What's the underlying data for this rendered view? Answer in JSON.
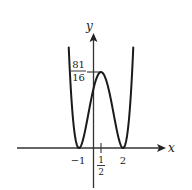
{
  "figure": {
    "function": "f(x) = (x+1)^2 (x-2)^2",
    "axes": {
      "x_label": "x",
      "y_label": "y"
    },
    "labels": {
      "max_value_num": "81",
      "max_value_den": "16",
      "x_tick_neg1": "−1",
      "x_tick_half_num": "1",
      "x_tick_half_den": "2",
      "x_tick_2": "2"
    },
    "colors": {
      "curve": "#1a1a1a",
      "axis": "#333333",
      "background": "#ffffff"
    }
  },
  "chart_data": {
    "type": "line",
    "title": "",
    "xlabel": "x",
    "ylabel": "y",
    "series": [
      {
        "name": "f(x) = (x+1)^2 (x-2)^2",
        "key_points": [
          {
            "x": -1,
            "y": 0,
            "note": "local minimum"
          },
          {
            "x": 0.5,
            "y": 5.0625,
            "note": "local maximum 81/16"
          },
          {
            "x": 2,
            "y": 0,
            "note": "local minimum"
          }
        ]
      }
    ],
    "x_ticks": [
      "-1",
      "1/2",
      "2"
    ],
    "y_ticks": [
      "81/16"
    ],
    "xlim": [
      -1.7,
      2.7
    ],
    "ylim": [
      0,
      7.2
    ],
    "grid": false
  }
}
